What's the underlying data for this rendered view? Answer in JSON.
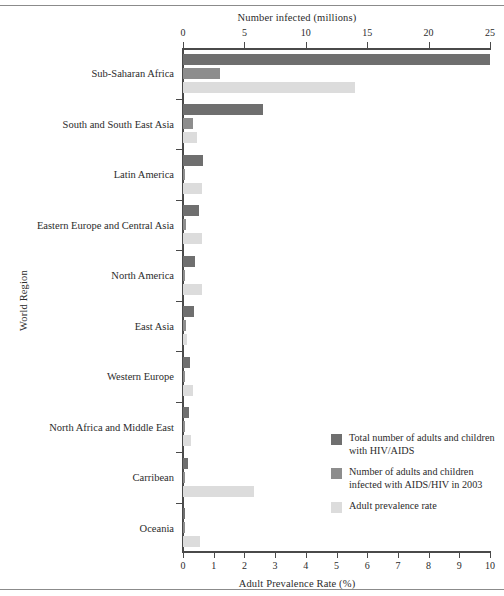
{
  "chart_data": {
    "type": "bar",
    "orientation": "horizontal",
    "title": "",
    "xlabel": "Number infected (millions)",
    "xlabel_secondary": "Adult Prevalence Rate (%)",
    "ylabel": "World Region",
    "xlim": [
      0,
      25
    ],
    "xlim_secondary": [
      0,
      10
    ],
    "xticks": [
      0,
      5,
      10,
      15,
      20,
      25
    ],
    "xticklabels": [
      "0",
      "5",
      "10",
      "15",
      "20",
      "25"
    ],
    "xticks_secondary": [
      0,
      1,
      2,
      3,
      4,
      5,
      6,
      7,
      8,
      9,
      10
    ],
    "xticklabels_secondary": [
      "0",
      "1",
      "2",
      "3",
      "4",
      "5",
      "6",
      "7",
      "8",
      "9",
      "10"
    ],
    "grid": false,
    "legend_position": "lower right",
    "categories": [
      "Sub-Saharan Africa",
      "South and South East Asia",
      "Latin America",
      "Eastern Europe and Central Asia",
      "North America",
      "East Asia",
      "Western Europe",
      "North  Africa and Middle East",
      "Carribean",
      "Oceania"
    ],
    "series": [
      {
        "name": "Total number of adults and children with HIV/AIDS",
        "axis": "top",
        "units": "millions",
        "color": "#6f6f6f",
        "values": [
          25.0,
          6.5,
          1.6,
          1.3,
          1.0,
          0.9,
          0.58,
          0.48,
          0.43,
          0.03
        ]
      },
      {
        "name": "Number of adults and children infected with AIDS/HIV in 2003",
        "axis": "top",
        "units": "millions",
        "color": "#8d8d8d",
        "values": [
          3.0,
          0.85,
          0.2,
          0.28,
          0.09,
          0.22,
          0.05,
          0.08,
          0.06,
          0.005
        ]
      },
      {
        "name": "Adult prevalence rate",
        "axis": "bottom",
        "units": "percent",
        "color": "#dcdcdc",
        "values": [
          5.6,
          0.45,
          0.62,
          0.63,
          0.62,
          0.12,
          0.33,
          0.25,
          2.3,
          0.55
        ]
      }
    ]
  },
  "legend": {
    "items": [
      {
        "label": "Total number of adults and children with HIV/AIDS",
        "color": "#6f6f6f"
      },
      {
        "label": "Number of adults and children infected with AIDS/HIV in 2003",
        "color": "#8d8d8d"
      },
      {
        "label": "Adult prevalence rate",
        "color": "#dcdcdc"
      }
    ]
  }
}
